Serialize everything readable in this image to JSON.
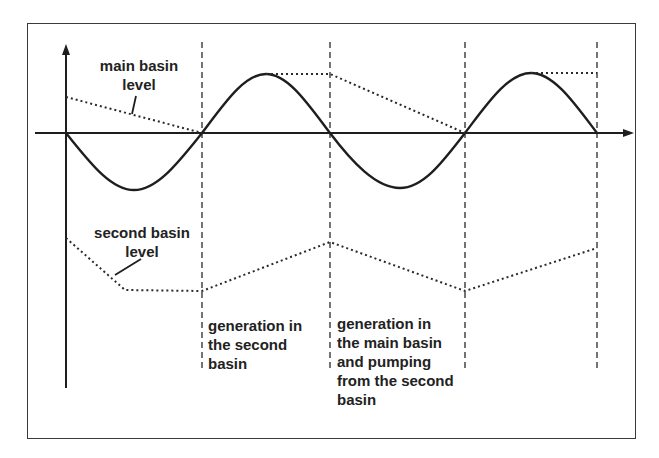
{
  "diagram": {
    "title": "",
    "labels": {
      "main_basin_level": "main basin\nlevel",
      "second_basin_level": "second basin\nlevel",
      "phase_generation_second": "generation in\nthe second\nbasin",
      "phase_generation_main_pumping": "generation in\nthe main basin\nand pumping\nfrom the second\nbasin"
    },
    "colors": {
      "line": "#1e1e1e",
      "frame": "#3a3a3a",
      "text": "#222222",
      "background": "#ffffff"
    },
    "tide_curve": {
      "type": "sine",
      "zero_crossings_x": [
        66,
        202,
        330,
        465,
        597
      ],
      "extrema": [
        {
          "x": 134,
          "y": 190,
          "kind": "trough"
        },
        {
          "x": 266,
          "y": 74,
          "kind": "peak"
        },
        {
          "x": 400,
          "y": 188,
          "kind": "trough"
        },
        {
          "x": 531,
          "y": 73,
          "kind": "peak"
        }
      ]
    },
    "main_basin_level_points": [
      [
        66,
        97
      ],
      [
        202,
        133
      ]
    ],
    "main_basin_level_points_2": [
      [
        266,
        74
      ],
      [
        330,
        74
      ],
      [
        465,
        133
      ]
    ],
    "main_basin_level_points_3": [
      [
        531,
        73
      ],
      [
        597,
        73
      ]
    ],
    "second_basin_level_points": [
      [
        66,
        238
      ],
      [
        125,
        290
      ],
      [
        202,
        291
      ],
      [
        330,
        242
      ],
      [
        465,
        291
      ],
      [
        597,
        248
      ]
    ],
    "phase_boundaries_x": [
      202,
      330,
      465,
      597
    ]
  }
}
